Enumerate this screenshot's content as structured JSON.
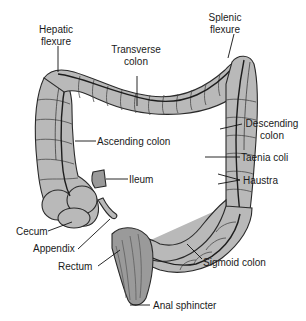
{
  "diagram": {
    "labels": {
      "hepatic_flexure": [
        "Hepatic",
        "flexure"
      ],
      "transverse_colon": [
        "Transverse",
        "colon"
      ],
      "splenic_flexure": [
        "Splenic",
        "flexure"
      ],
      "descending_colon": [
        "Descending",
        "colon"
      ],
      "ascending_colon": "Ascending colon",
      "taenia_coli": "Taenia coli",
      "haustra": "Haustra",
      "ileum": "Ileum",
      "cecum": "Cecum",
      "appendix": "Appendix",
      "rectum": "Rectum",
      "sigmoid_colon": "Sigmoid colon",
      "anal_sphincter": "Anal sphincter"
    },
    "colors": {
      "background": "#ffffff",
      "tissue_fill": "#b9b9b9",
      "tissue_dark": "#9a9a9a",
      "outline": "#2a2a2a",
      "text": "#1a1a1a"
    }
  }
}
